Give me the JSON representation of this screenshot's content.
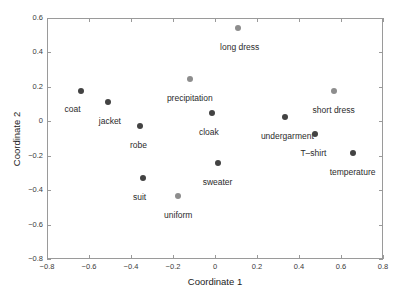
{
  "chart_data": {
    "type": "scatter",
    "title": "",
    "xlabel": "Coordinate 1",
    "ylabel": "Coordinate 2",
    "xlim": [
      -0.8,
      0.8
    ],
    "ylim": [
      -0.8,
      0.6
    ],
    "xticks": [
      "-0.8",
      "-0.6",
      "-0.4",
      "-0.2",
      "0",
      "0.2",
      "0.4",
      "0.6",
      "0.8"
    ],
    "xtick_values": [
      -0.8,
      -0.6,
      -0.4,
      -0.2,
      0,
      0.2,
      0.4,
      0.6,
      0.8
    ],
    "yticks": [
      "-0.8",
      "-0.6",
      "-0.4",
      "-0.2",
      "0",
      "0.2",
      "0.4",
      "0.6"
    ],
    "ytick_values": [
      -0.8,
      -0.6,
      -0.4,
      -0.2,
      0,
      0.2,
      0.4,
      0.6
    ],
    "grid": false,
    "legend": "none",
    "marker_colors": {
      "dark": "#434343",
      "light": "#8d8d8d"
    },
    "points": [
      {
        "label": "coat",
        "x": -0.64,
        "y": 0.175,
        "group": "dark",
        "label_dx": -8,
        "label_dy": 14
      },
      {
        "label": "jacket",
        "x": -0.51,
        "y": 0.11,
        "group": "dark",
        "label_dx": 2,
        "label_dy": 15
      },
      {
        "label": "robe",
        "x": -0.355,
        "y": -0.028,
        "group": "dark",
        "label_dx": -2,
        "label_dy": 15
      },
      {
        "label": "suit",
        "x": -0.345,
        "y": -0.328,
        "group": "dark",
        "label_dx": -3,
        "label_dy": 15
      },
      {
        "label": "uniform",
        "x": -0.175,
        "y": -0.435,
        "group": "light",
        "label_dx": 0,
        "label_dy": 15
      },
      {
        "label": "precipitation",
        "x": -0.12,
        "y": 0.248,
        "group": "light",
        "label_dx": 0,
        "label_dy": 15
      },
      {
        "label": "cloak",
        "x": -0.015,
        "y": 0.048,
        "group": "dark",
        "label_dx": -3,
        "label_dy": 15
      },
      {
        "label": "sweater",
        "x": 0.012,
        "y": -0.243,
        "group": "dark",
        "label_dx": 0,
        "label_dy": 15
      },
      {
        "label": "long dress",
        "x": 0.108,
        "y": 0.54,
        "group": "light",
        "label_dx": 2,
        "label_dy": 15
      },
      {
        "label": "undergarment",
        "x": 0.335,
        "y": 0.022,
        "group": "dark",
        "label_dx": 2,
        "label_dy": 15
      },
      {
        "label": "T-shirt",
        "x": 0.478,
        "y": -0.072,
        "group": "dark",
        "label_dx": -2,
        "label_dy": 15
      },
      {
        "label": "short dress",
        "x": 0.565,
        "y": 0.178,
        "group": "light",
        "label_dx": 0,
        "label_dy": 15
      },
      {
        "label": "temperature",
        "x": 0.655,
        "y": -0.185,
        "group": "dark",
        "label_dx": 0,
        "label_dy": 15
      }
    ]
  }
}
